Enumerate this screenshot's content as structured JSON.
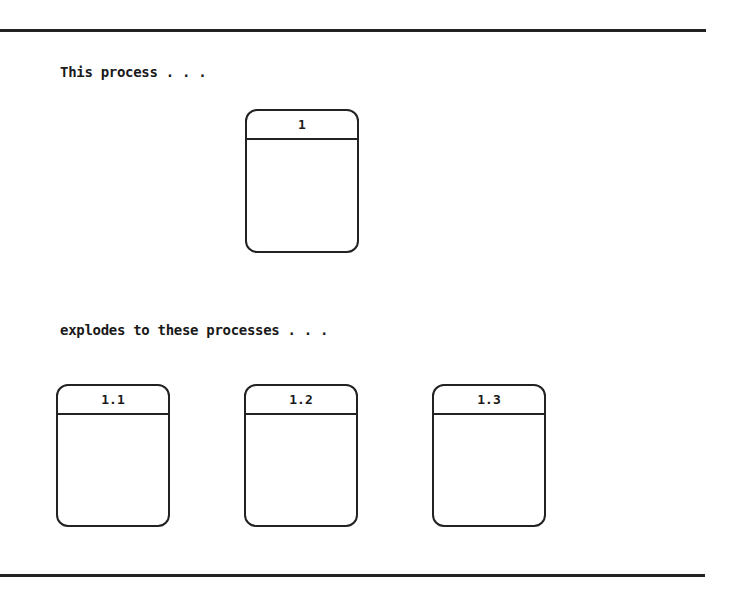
{
  "diagram": {
    "caption_top": "This process . . .",
    "caption_bottom": "explodes to these processes . . .",
    "parent_process": {
      "id": "1"
    },
    "child_processes": [
      {
        "id": "1.1"
      },
      {
        "id": "1.2"
      },
      {
        "id": "1.3"
      }
    ]
  }
}
